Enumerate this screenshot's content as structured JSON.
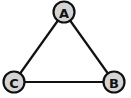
{
  "diagram": {
    "type": "graph",
    "directed": false,
    "nodes": [
      {
        "id": "A",
        "label": "A",
        "x": 64,
        "y": 12
      },
      {
        "id": "B",
        "label": "B",
        "x": 114,
        "y": 82
      },
      {
        "id": "C",
        "label": "C",
        "x": 14,
        "y": 82
      }
    ],
    "edges": [
      {
        "from": "A",
        "to": "B"
      },
      {
        "from": "A",
        "to": "C"
      },
      {
        "from": "C",
        "to": "B"
      }
    ],
    "colors": {
      "node_fill": "#d4d4d4",
      "stroke": "#111111",
      "background": "#ffffff"
    }
  }
}
